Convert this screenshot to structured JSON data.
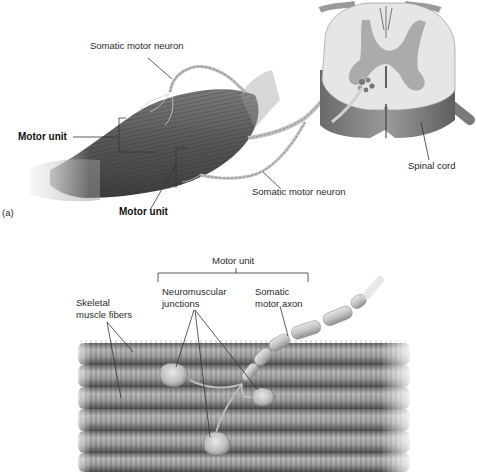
{
  "panel_a": {
    "tag": "(a)",
    "labels": {
      "somatic_motor_neuron_top": "Somatic motor neuron",
      "motor_unit_left": "Motor unit",
      "motor_unit_bottom": "Motor unit",
      "somatic_motor_neuron_bottom": "Somatic motor neuron",
      "spinal_cord": "Spinal cord"
    }
  },
  "panel_b": {
    "labels": {
      "motor_unit": "Motor unit",
      "neuromuscular_junctions_line1": "Neuromuscular",
      "neuromuscular_junctions_line2": "junctions",
      "somatic_motor_axon_line1": "Somatic",
      "somatic_motor_axon_line2": "motor axon",
      "skeletal_muscle_fibers_line1": "Skeletal",
      "skeletal_muscle_fibers_line2": "muscle fibers"
    }
  },
  "colors": {
    "muscle_dark": "#4a4a4a",
    "muscle_mid": "#6e6e6e",
    "spinal_white_matter": "#e4e4e4",
    "spinal_gray_matter": "#a8a8a8",
    "spinal_side": "#7a7a7a",
    "fiber_light": "#bdbdbd",
    "fiber_dark": "#5c5c5c",
    "axon": "#c8c8c8",
    "leader_line": "#333333"
  }
}
